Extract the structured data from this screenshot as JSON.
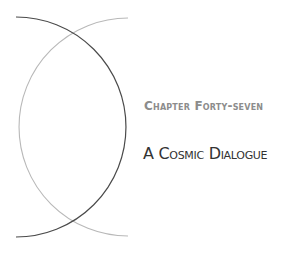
{
  "chapter": {
    "label": "Chapter Forty-seven",
    "title": "A Cosmic Dialogue"
  },
  "decoration": {
    "dark_arc_color": "#4a4a4a",
    "light_arc_color": "#b8b8b8",
    "background": "#ffffff"
  }
}
